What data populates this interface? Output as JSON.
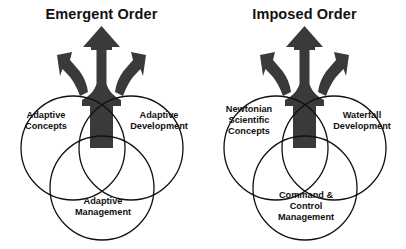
{
  "diagram": {
    "type": "venn-with-trident-arrow",
    "background_color": "#ffffff",
    "arrow_color": "#3a3a3a",
    "outline_color": "#111111",
    "panels": [
      {
        "id": "emergent-order",
        "title": "Emergent Order",
        "arrow": {
          "name": "trident-arrow",
          "direction": "upward",
          "branches": 3,
          "branch_directions": [
            "up-left",
            "up",
            "up-right"
          ]
        },
        "circles": [
          {
            "position": "upper-left",
            "label": "Adaptive\nConcepts"
          },
          {
            "position": "upper-right",
            "label": "Adaptive\nDevelopment"
          },
          {
            "position": "bottom",
            "label": "Adaptive\nManagement"
          }
        ]
      },
      {
        "id": "imposed-order",
        "title": "Imposed Order",
        "arrow": {
          "name": "trident-arrow",
          "direction": "upward",
          "branches": 3,
          "branch_directions": [
            "up-left",
            "up",
            "up-right"
          ]
        },
        "circles": [
          {
            "position": "upper-left",
            "label": "Newtonian\nScientific\nConcepts"
          },
          {
            "position": "upper-right",
            "label": "Waterfall\nDevelopment"
          },
          {
            "position": "bottom",
            "label": "Command &\nControl\nManagement"
          }
        ]
      }
    ]
  }
}
